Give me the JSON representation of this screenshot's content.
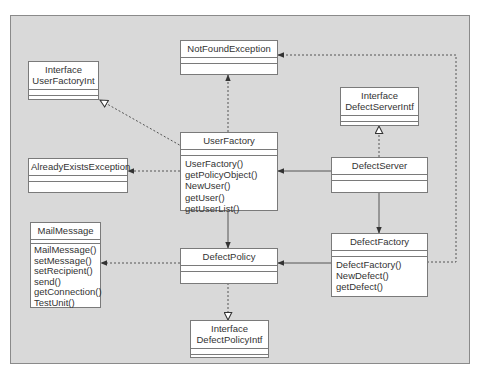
{
  "diagram": {
    "type": "uml-class-diagram",
    "classes": [
      {
        "id": "notfound",
        "stereotype": "",
        "name": "NotFoundException",
        "operations": []
      },
      {
        "id": "userfactoryint",
        "stereotype": "Interface",
        "name": "UserFactoryInt",
        "operations": []
      },
      {
        "id": "defectserverintf",
        "stereotype": "Interface",
        "name": "DefectServerIntf",
        "operations": []
      },
      {
        "id": "userfactory",
        "stereotype": "",
        "name": "UserFactory",
        "operations": [
          "UserFactory()",
          "getPolicyObject()",
          "NewUser()",
          "getUser()",
          "getUserList()"
        ]
      },
      {
        "id": "alreadyexists",
        "stereotype": "",
        "name": "AlreadyExistsException",
        "operations": []
      },
      {
        "id": "defectserver",
        "stereotype": "",
        "name": "DefectServer",
        "operations": []
      },
      {
        "id": "mailmessage",
        "stereotype": "",
        "name": "MailMessage",
        "operations": [
          "MailMessage()",
          "setMessage()",
          "setRecipient()",
          "send()",
          "getConnection()",
          "TestUnit()"
        ]
      },
      {
        "id": "defectfactory",
        "stereotype": "",
        "name": "DefectFactory",
        "operations": [
          "DefectFactory()",
          "NewDefect()",
          "getDefect()"
        ]
      },
      {
        "id": "defectpolicy",
        "stereotype": "",
        "name": "DefectPolicy",
        "operations": []
      },
      {
        "id": "defectpolicyintf",
        "stereotype": "Interface",
        "name": "DefectPolicyIntf",
        "operations": []
      }
    ],
    "relationships": [
      {
        "from": "userfactory",
        "to": "notfound",
        "kind": "dependency"
      },
      {
        "from": "userfactory",
        "to": "userfactoryint",
        "kind": "realization"
      },
      {
        "from": "userfactory",
        "to": "alreadyexists",
        "kind": "dependency"
      },
      {
        "from": "userfactory",
        "to": "defectpolicy",
        "kind": "association"
      },
      {
        "from": "defectserver",
        "to": "defectserverintf",
        "kind": "realization"
      },
      {
        "from": "defectserver",
        "to": "userfactory",
        "kind": "association"
      },
      {
        "from": "defectserver",
        "to": "defectfactory",
        "kind": "association"
      },
      {
        "from": "defectfactory",
        "to": "defectpolicy",
        "kind": "association"
      },
      {
        "from": "defectfactory",
        "to": "notfound",
        "kind": "dependency"
      },
      {
        "from": "defectpolicy",
        "to": "mailmessage",
        "kind": "dependency"
      },
      {
        "from": "defectpolicy",
        "to": "defectpolicyintf",
        "kind": "realization"
      }
    ],
    "colors": {
      "background": "#d9d9d9",
      "box": "#ffffff",
      "line": "#555555"
    }
  }
}
